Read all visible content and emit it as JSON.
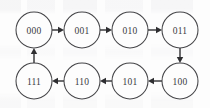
{
  "diagram": {
    "type": "directed-cycle-graph",
    "colors": {
      "background": "#fdfdfd",
      "node_stroke": "#454548",
      "node_fill": "#fdfdfd",
      "label_text": "#3a3a3d",
      "edge": "#3c3c3f",
      "arrowhead": "#2e2e31"
    },
    "geometry": {
      "node_radius": 18,
      "width": 210,
      "height": 108
    },
    "nodes": [
      {
        "id": "000",
        "label": "000",
        "cx": 34,
        "cy": 30,
        "row": "top",
        "col": 0
      },
      {
        "id": "001",
        "label": "001",
        "cx": 82,
        "cy": 30,
        "row": "top",
        "col": 1
      },
      {
        "id": "010",
        "label": "010",
        "cx": 130,
        "cy": 30,
        "row": "top",
        "col": 2
      },
      {
        "id": "011",
        "label": "011",
        "cx": 180,
        "cy": 30,
        "row": "top",
        "col": 3
      },
      {
        "id": "111",
        "label": "111",
        "cx": 34,
        "cy": 81,
        "row": "bottom",
        "col": 0
      },
      {
        "id": "110",
        "label": "110",
        "cx": 82,
        "cy": 81,
        "row": "bottom",
        "col": 1
      },
      {
        "id": "101",
        "label": "101",
        "cx": 130,
        "cy": 81,
        "row": "bottom",
        "col": 2
      },
      {
        "id": "100",
        "label": "100",
        "cx": 180,
        "cy": 81,
        "row": "bottom",
        "col": 3
      }
    ],
    "edges": [
      {
        "from": "000",
        "to": "001",
        "direction": "right"
      },
      {
        "from": "001",
        "to": "010",
        "direction": "right"
      },
      {
        "from": "010",
        "to": "011",
        "direction": "right"
      },
      {
        "from": "011",
        "to": "100",
        "direction": "down"
      },
      {
        "from": "100",
        "to": "101",
        "direction": "left"
      },
      {
        "from": "101",
        "to": "110",
        "direction": "left"
      },
      {
        "from": "110",
        "to": "111",
        "direction": "left"
      },
      {
        "from": "111",
        "to": "000",
        "direction": "up"
      }
    ],
    "cycle_order": [
      "000",
      "001",
      "010",
      "011",
      "100",
      "101",
      "110",
      "111"
    ]
  }
}
